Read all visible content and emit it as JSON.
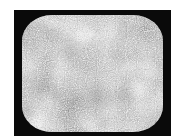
{
  "image": {
    "subject": "television screen showing static noise",
    "alt": "CRT television screen filled with grainy grey static",
    "colors": {
      "frame": "#0a0a0a",
      "static_base": "#7a7a7a",
      "background": "#ffffff"
    }
  }
}
